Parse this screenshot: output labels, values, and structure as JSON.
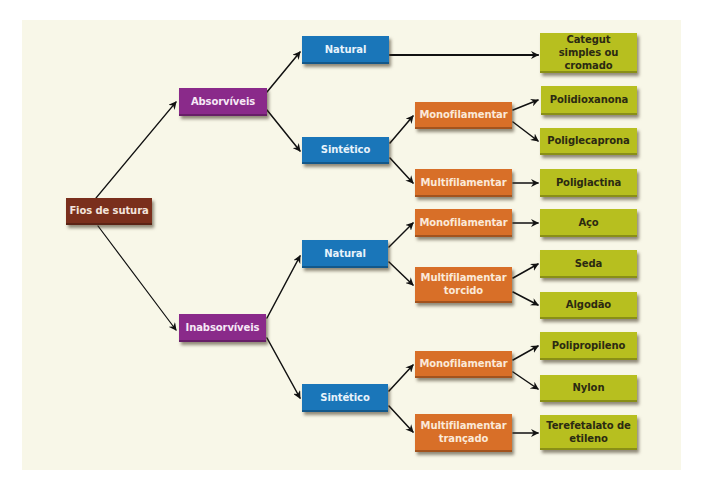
{
  "colors": {
    "background_panel": "#f8f7e8",
    "root": "#7a2f1c",
    "category": "#8a2a8a",
    "origin": "#1a76b9",
    "structure": "#d86f28",
    "material": "#b7bf1f",
    "arrow": "#111111"
  },
  "root": {
    "label": "Fios de sutura"
  },
  "categories": [
    {
      "label": "Absorvíveis",
      "origins": [
        {
          "label": "Natural",
          "materials": [
            "Categut simples ou cromado"
          ]
        },
        {
          "label": "Sintético",
          "structures": [
            {
              "label": "Monofilamentar",
              "materials": [
                "Polidioxanona",
                "Poliglecaprona"
              ]
            },
            {
              "label": "Multifilamentar",
              "materials": [
                "Poliglactina"
              ]
            }
          ]
        }
      ]
    },
    {
      "label": "Inabsorvíveis",
      "origins": [
        {
          "label": "Natural",
          "structures": [
            {
              "label": "Monofilamentar",
              "materials": [
                "Aço"
              ]
            },
            {
              "label": "Multifilamentar torcido",
              "materials": [
                "Seda",
                "Algodão"
              ]
            }
          ]
        },
        {
          "label": "Sintético",
          "structures": [
            {
              "label": "Monofilamentar",
              "materials": [
                "Polipropileno",
                "Nylon"
              ]
            },
            {
              "label": "Multifilamentar trançado",
              "materials": [
                "Terefetalato de etileno"
              ]
            }
          ]
        }
      ]
    }
  ],
  "nodes": {
    "root": "Fios de sutura",
    "absorviveis": "Absorvíveis",
    "inabsorviveis": "Inabsorvíveis",
    "abs_natural": "Natural",
    "abs_sintetico": "Sintético",
    "inabs_natural": "Natural",
    "inabs_sintetico": "Sintético",
    "abs_sint_mono": "Monofilamentar",
    "abs_sint_multi": "Multifilamentar",
    "inabs_nat_mono": "Monofilamentar",
    "inabs_nat_multi": "Multifilamentar torcido",
    "inabs_sint_mono": "Monofilamentar",
    "inabs_sint_multi": "Multifilamentar trançado",
    "categut": "Categut simples ou cromado",
    "polidioxanona": "Polidioxanona",
    "poliglecaprona": "Poliglecaprona",
    "poliglactina": "Poliglactina",
    "aco": "Aço",
    "seda": "Seda",
    "algodao": "Algodão",
    "polipropileno": "Polipropileno",
    "nylon": "Nylon",
    "terefetalato": "Terefetalato de etileno"
  }
}
